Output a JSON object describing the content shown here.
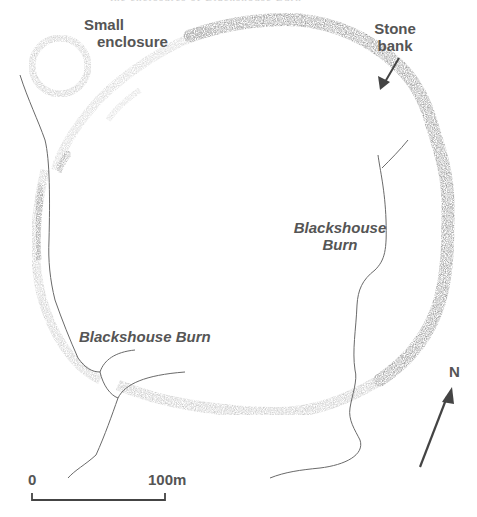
{
  "figure": {
    "type": "archaeological site plan",
    "header_fragment": "the enclosures of Blackshouse Burn"
  },
  "labels": {
    "small_enclosure_line1": "Small",
    "small_enclosure_line2": "enclosure",
    "stone_bank_line1": "Stone",
    "stone_bank_line2": "bank",
    "burn_east_line1": "Blackshouse",
    "burn_east_line2": "Burn",
    "burn_southwest": "Blackshouse Burn"
  },
  "north_arrow": {
    "label": "N"
  },
  "scale_bar": {
    "start_label": "0",
    "end_label": "100m"
  },
  "colors": {
    "bank_dark": "#8c8c8c",
    "bank_light": "#cfcfcf",
    "stream": "#666666",
    "text": "#555555"
  }
}
